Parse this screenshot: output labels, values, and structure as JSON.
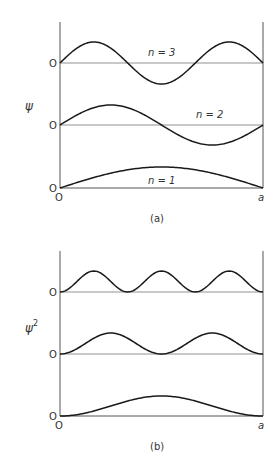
{
  "figure": {
    "panel_a": {
      "caption": "(a)",
      "ylabel": "ψ",
      "x_start_label": "O",
      "x_end_label": "a",
      "curves": [
        {
          "n": 3,
          "label": "n = 3",
          "zero_label": "O",
          "function": "sin(3πx/a)"
        },
        {
          "n": 2,
          "label": "n = 2",
          "zero_label": "O",
          "function": "sin(2πx/a)"
        },
        {
          "n": 1,
          "label": "n = 1",
          "zero_label": "O",
          "function": "sin(πx/a)"
        }
      ]
    },
    "panel_b": {
      "caption": "(b)",
      "ylabel": "ψ",
      "ylabel_sup": "2",
      "x_start_label": "O",
      "x_end_label": "a",
      "curves": [
        {
          "n": 3,
          "zero_label": "O",
          "function": "sin²(3πx/a)"
        },
        {
          "n": 2,
          "zero_label": "O",
          "function": "sin²(2πx/a)"
        },
        {
          "n": 1,
          "zero_label": "O",
          "function": "sin²(πx/a)"
        }
      ]
    },
    "line_color": "#1a1a1a",
    "axis_color": "#555555"
  }
}
